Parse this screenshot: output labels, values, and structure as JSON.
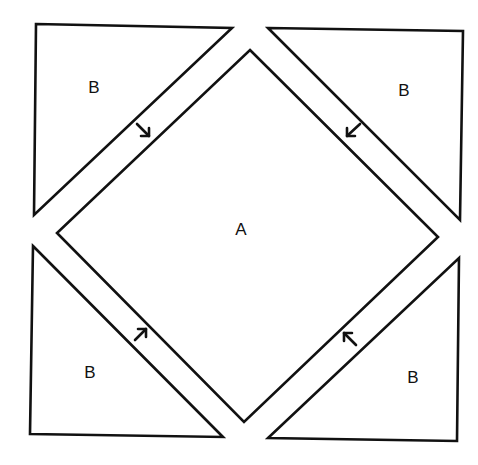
{
  "diagram": {
    "type": "quilt-block-pattern",
    "colors": {
      "stroke": "#111111",
      "background": "#ffffff"
    },
    "center_piece": {
      "label": "A",
      "shape": "square-on-point"
    },
    "corner_pieces": [
      {
        "position": "top-left",
        "label": "B",
        "arrow": "down-right toward A"
      },
      {
        "position": "top-right",
        "label": "B",
        "arrow": "down-left toward A"
      },
      {
        "position": "bottom-left",
        "label": "B",
        "arrow": "up-right toward A"
      },
      {
        "position": "bottom-right",
        "label": "B",
        "arrow": "up-left toward A"
      }
    ]
  }
}
